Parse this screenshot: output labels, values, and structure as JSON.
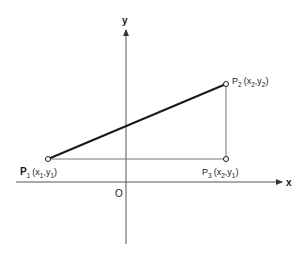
{
  "diagram": {
    "type": "coordinate-geometry",
    "axes": {
      "x_label": "x",
      "y_label": "y",
      "origin_label": "O"
    },
    "points": [
      {
        "id": "P1",
        "name": "P",
        "sub": "1",
        "coords_text": [
          "x",
          "1",
          "y",
          "1"
        ],
        "label": "P1(x1,y1)"
      },
      {
        "id": "P2",
        "name": "P",
        "sub": "2",
        "coords_text": [
          "x",
          "2",
          "y",
          "2"
        ],
        "label": "P2(x2,y2)"
      },
      {
        "id": "P3",
        "name": "P",
        "sub": "3",
        "coords_text": [
          "x",
          "2",
          "y",
          "1"
        ],
        "label": "P3(x2,y1)"
      }
    ],
    "segments": [
      {
        "from": "P1",
        "to": "P2",
        "style": "bold"
      },
      {
        "from": "P1",
        "to": "P3",
        "style": "thin"
      },
      {
        "from": "P3",
        "to": "P2",
        "style": "thin"
      }
    ],
    "colors": {
      "ink": "#1a1a1a",
      "axis": "#555555",
      "background": "#ffffff"
    }
  }
}
